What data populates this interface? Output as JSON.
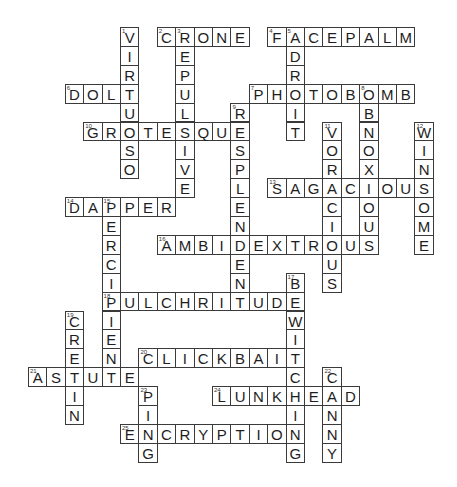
{
  "puzzle": {
    "grid": {
      "origin_x": 120,
      "origin_y": 27,
      "cell_w": 18.4,
      "cell_h": 18.9
    },
    "words": [
      {
        "number": 1,
        "answer": "VIRTUOSO",
        "direction": "down",
        "col": 0,
        "row": 0
      },
      {
        "number": 2,
        "answer": "CRONE",
        "direction": "across",
        "col": 2,
        "row": 0
      },
      {
        "number": 3,
        "answer": "REPULSIVE",
        "direction": "down",
        "col": 3,
        "row": 0
      },
      {
        "number": 4,
        "answer": "FACEPALM",
        "direction": "across",
        "col": 8,
        "row": 0
      },
      {
        "number": 5,
        "answer": "ADROIT",
        "direction": "down",
        "col": 9,
        "row": 0
      },
      {
        "number": 6,
        "answer": "DOLT",
        "direction": "across",
        "col": -3,
        "row": 3
      },
      {
        "number": 7,
        "answer": "PHOTOBOMB",
        "direction": "across",
        "col": 7,
        "row": 3
      },
      {
        "number": 8,
        "answer": "OBNOXIOUS",
        "direction": "down",
        "col": 13,
        "row": 3
      },
      {
        "number": 9,
        "answer": "RESPLENDENT",
        "direction": "down",
        "col": 6,
        "row": 4
      },
      {
        "number": 10,
        "answer": "GROTESQUE",
        "direction": "across",
        "col": -2,
        "row": 5
      },
      {
        "number": 11,
        "answer": "VORACIOUS",
        "direction": "down",
        "col": 11,
        "row": 5
      },
      {
        "number": 12,
        "answer": "WINSOME",
        "direction": "down",
        "col": 16,
        "row": 5
      },
      {
        "number": 13,
        "answer": "SAGACIOUS",
        "direction": "across",
        "col": 8,
        "row": 8
      },
      {
        "number": 14,
        "answer": "DAPPER",
        "direction": "across",
        "col": -3,
        "row": 9
      },
      {
        "number": 15,
        "answer": "PERCIPIENT",
        "direction": "down",
        "col": -1,
        "row": 9
      },
      {
        "number": 16,
        "answer": "AMBIDEXTROUS",
        "direction": "across",
        "col": 2,
        "row": 11
      },
      {
        "number": 17,
        "answer": "BEWITCHING",
        "direction": "down",
        "col": 9,
        "row": 13
      },
      {
        "number": 18,
        "answer": "PULCHRITUDE",
        "direction": "across",
        "col": -1,
        "row": 14
      },
      {
        "number": 19,
        "answer": "CRETIN",
        "direction": "down",
        "col": -3,
        "row": 15
      },
      {
        "number": 20,
        "answer": "CLICKBAIT",
        "direction": "across",
        "col": 1,
        "row": 17
      },
      {
        "number": 21,
        "answer": "ASTUTE",
        "direction": "across",
        "col": -5,
        "row": 18
      },
      {
        "number": 22,
        "answer": "CANNY",
        "direction": "down",
        "col": 11,
        "row": 18
      },
      {
        "number": 23,
        "answer": "PING",
        "direction": "down",
        "col": 1,
        "row": 19
      },
      {
        "number": 24,
        "answer": "LUNKHEAD",
        "direction": "across",
        "col": 5,
        "row": 19
      },
      {
        "number": 25,
        "answer": "ENCRYPTION",
        "direction": "across",
        "col": 0,
        "row": 21
      }
    ]
  }
}
